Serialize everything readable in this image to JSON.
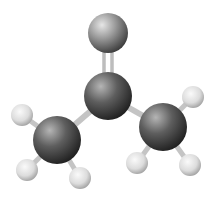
{
  "image": {
    "subject": "acetone molecule ball-and-stick model",
    "background": "#ffffff"
  },
  "atoms": [
    {
      "id": "O",
      "element": "oxygen",
      "cx": 108,
      "cy": 33,
      "r": 20,
      "color": "#8a8a8a"
    },
    {
      "id": "C1",
      "element": "carbon",
      "cx": 108,
      "cy": 96,
      "r": 24,
      "color": "#5e5e5e"
    },
    {
      "id": "C2",
      "element": "carbon",
      "cx": 57,
      "cy": 140,
      "r": 24,
      "color": "#4a4a4a"
    },
    {
      "id": "C3",
      "element": "carbon",
      "cx": 163,
      "cy": 127,
      "r": 24,
      "color": "#4a4a4a"
    },
    {
      "id": "H1",
      "element": "hydrogen",
      "cx": 22,
      "cy": 115,
      "r": 11,
      "color": "#dcdcdc"
    },
    {
      "id": "H2",
      "element": "hydrogen",
      "cx": 27,
      "cy": 170,
      "r": 11,
      "color": "#dcdcdc"
    },
    {
      "id": "H3",
      "element": "hydrogen",
      "cx": 80,
      "cy": 178,
      "r": 11,
      "color": "#dcdcdc"
    },
    {
      "id": "H4",
      "element": "hydrogen",
      "cx": 193,
      "cy": 97,
      "r": 11,
      "color": "#dcdcdc"
    },
    {
      "id": "H5",
      "element": "hydrogen",
      "cx": 137,
      "cy": 163,
      "r": 11,
      "color": "#dcdcdc"
    },
    {
      "id": "H6",
      "element": "hydrogen",
      "cx": 190,
      "cy": 165,
      "r": 11,
      "color": "#dcdcdc"
    }
  ]
}
